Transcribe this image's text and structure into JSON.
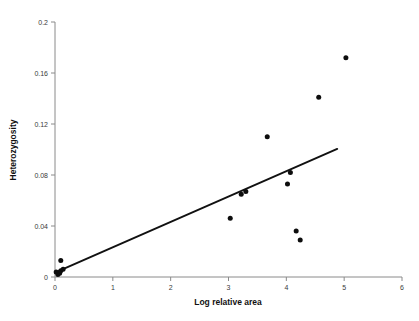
{
  "chart_data": {
    "type": "scatter",
    "title": "",
    "xlabel": "Log relative area",
    "ylabel": "Heterozygosity",
    "xlim": [
      0,
      6
    ],
    "ylim": [
      0,
      0.2
    ],
    "xticks": [
      0,
      1,
      2,
      3,
      4,
      5,
      6
    ],
    "xtick_labels": [
      "0",
      "1",
      "2",
      "3",
      "4",
      "5",
      "6"
    ],
    "yticks": [
      0,
      0.04,
      0.08,
      0.12,
      0.16,
      0.2
    ],
    "ytick_labels": [
      "0",
      "0.04",
      "0.08",
      "0.12",
      "0.16",
      "0.2"
    ],
    "grid": false,
    "legend": null,
    "marker_color": "#0d0d0d",
    "line_color": "#111111",
    "axis_color": "#8a8a8a",
    "points": [
      {
        "x": 0.02,
        "y": 0.004
      },
      {
        "x": 0.05,
        "y": 0.002
      },
      {
        "x": 0.08,
        "y": 0.003
      },
      {
        "x": 0.1,
        "y": 0.005
      },
      {
        "x": 0.14,
        "y": 0.006
      },
      {
        "x": 0.1,
        "y": 0.013
      },
      {
        "x": 3.03,
        "y": 0.046
      },
      {
        "x": 3.22,
        "y": 0.065
      },
      {
        "x": 3.3,
        "y": 0.067
      },
      {
        "x": 3.67,
        "y": 0.11
      },
      {
        "x": 4.02,
        "y": 0.073
      },
      {
        "x": 4.07,
        "y": 0.082
      },
      {
        "x": 4.17,
        "y": 0.036
      },
      {
        "x": 4.24,
        "y": 0.029
      },
      {
        "x": 4.56,
        "y": 0.141
      },
      {
        "x": 5.03,
        "y": 0.172
      }
    ],
    "fit_line": {
      "type": "linear-regression",
      "x_start": 0.0,
      "y_start": 0.0035,
      "x_end": 4.88,
      "y_end": 0.1005
    }
  }
}
